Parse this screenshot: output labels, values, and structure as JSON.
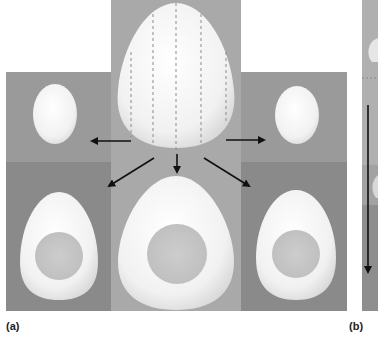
{
  "figure": {
    "panel_a_label": "(a)",
    "panel_b_label": "(b)",
    "colors": {
      "background": "#ffffff",
      "center_panel": "#a9a9a9",
      "side_panel_top": "#9a9a9a",
      "side_panel_bottom": "#8a8a8a",
      "egg_white": "#f4f4f4",
      "yolk": "#c8c8c8",
      "arrow": "#111111",
      "dashed_line": "#8c8c8c"
    },
    "panel_a": {
      "description": "Whole egg sliced along dashed vertical lines; slices shown as cross sections with yolk",
      "top_center": {
        "item": "whole-egg",
        "dashed_cut_lines": 5
      },
      "top_side": [
        {
          "item": "small-egg-slice-left"
        },
        {
          "item": "small-egg-slice-right"
        }
      ],
      "bottom_row": [
        {
          "item": "egg-cross-section-left",
          "has_yolk": true
        },
        {
          "item": "egg-cross-section-center",
          "has_yolk": true
        },
        {
          "item": "egg-cross-section-right",
          "has_yolk": true
        }
      ],
      "arrows": [
        "left",
        "down-left",
        "down",
        "down-right",
        "right"
      ]
    },
    "panel_b": {
      "description": "Partially visible panel with vertical downward arrow",
      "arrows": [
        "down"
      ]
    }
  }
}
